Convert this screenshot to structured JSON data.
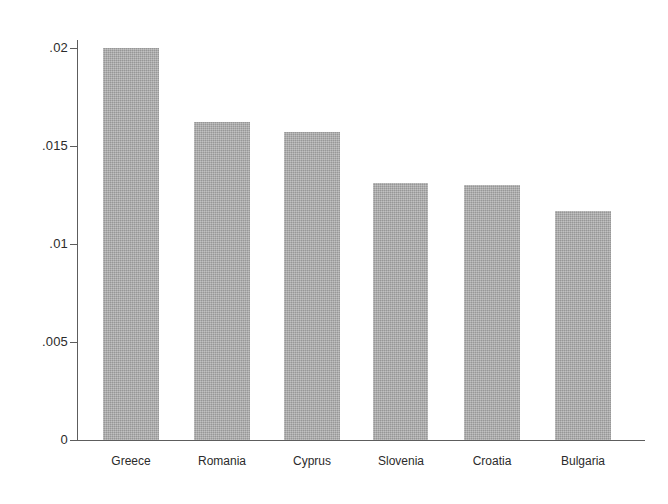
{
  "chart_data": {
    "type": "bar",
    "title": "",
    "subtitle": "",
    "xlabel": "",
    "ylabel": "",
    "categories": [
      "Greece",
      "Romania",
      "Cyprus",
      "Slovenia",
      "Croatia",
      "Bulgaria"
    ],
    "values": [
      0.02,
      0.0162,
      0.0157,
      0.0131,
      0.013,
      0.0117
    ],
    "ylim": [
      0,
      0.0205
    ],
    "ytick_values": [
      0,
      0.005,
      0.01,
      0.015,
      0.02
    ],
    "ytick_labels": [
      "0",
      ".005",
      ".01",
      ".015",
      ".02"
    ],
    "grid": false,
    "legend": null,
    "legend_position": "none",
    "annotations": [],
    "bar_color": "#a9a9a9",
    "axis_color": "#5d5d5d",
    "background_color": "#ffffff",
    "text_color": "#2b2b2b"
  },
  "axis": {
    "y_tick_0": "0",
    "y_tick_1": ".005",
    "y_tick_2": ".01",
    "y_tick_3": ".015",
    "y_tick_4": ".02"
  },
  "bars": {
    "b0": {
      "label": "Greece",
      "value": "0.02"
    },
    "b1": {
      "label": "Romania",
      "value": "0.0162"
    },
    "b2": {
      "label": "Cyprus",
      "value": "0.0157"
    },
    "b3": {
      "label": "Slovenia",
      "value": "0.0131"
    },
    "b4": {
      "label": "Croatia",
      "value": "0.013"
    },
    "b5": {
      "label": "Bulgaria",
      "value": "0.0117"
    }
  }
}
